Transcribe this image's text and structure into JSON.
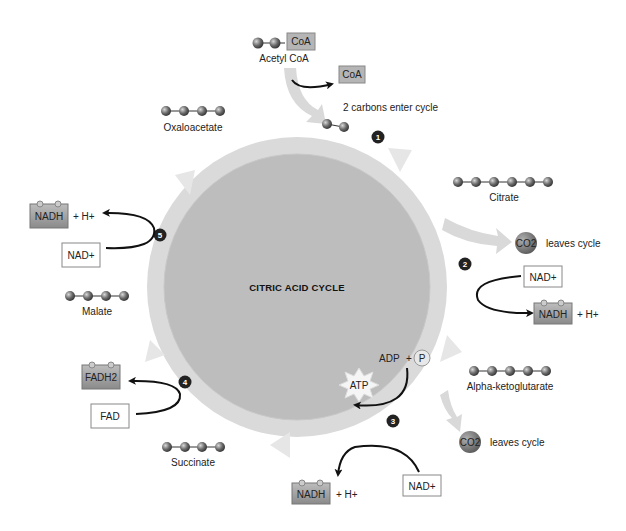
{
  "diagram": {
    "title": "CITRIC ACID CYCLE",
    "molecules": {
      "acetyl_coa": {
        "label": "Acetyl CoA",
        "tag": "CoA",
        "carbons": 2
      },
      "coa_released": {
        "tag": "CoA"
      },
      "entry_note": "2 carbons enter cycle",
      "oxaloacetate": {
        "label": "Oxaloacetate",
        "carbons": 4
      },
      "citrate": {
        "label": "Citrate",
        "carbons": 6
      },
      "alpha_ketoglutarate": {
        "label": "Alpha-ketoglutarate",
        "carbons": 5
      },
      "succinate": {
        "label": "Succinate",
        "carbons": 4
      },
      "malate": {
        "label": "Malate",
        "carbons": 4
      }
    },
    "co2_outputs": [
      {
        "molecule": "CO2",
        "note": "leaves cycle"
      },
      {
        "molecule": "CO2",
        "note": "leaves cycle"
      }
    ],
    "steps": [
      "1",
      "2",
      "3",
      "4",
      "5"
    ],
    "cofactors": {
      "step2": {
        "input": "NAD+",
        "output": "NADH",
        "extra": "+ H+"
      },
      "step3": {
        "input": "NAD+",
        "output": "NADH",
        "extra": "+ H+",
        "adp": "ADP",
        "plus": "+",
        "p": "P",
        "atp": "ATP"
      },
      "step4": {
        "input": "FAD",
        "output": "FADH2"
      },
      "step5": {
        "input": "NAD+",
        "output": "NADH",
        "extra": "+ H+"
      }
    },
    "colors": {
      "ring": "#d4d4d4",
      "center": "#b8b8b8",
      "reduced_box": "#9a9a9a",
      "step_badge": "#222222",
      "co2": "#7a7a7a"
    }
  }
}
